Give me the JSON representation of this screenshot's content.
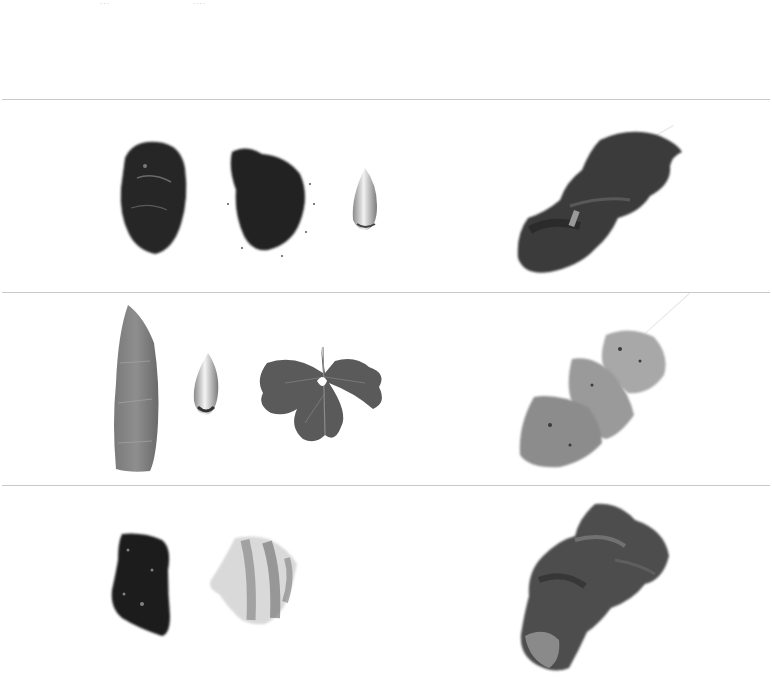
{
  "page": {
    "type": "recipe-plate",
    "palette": {
      "background": "#ffffff",
      "rule": "#c9c9c9",
      "dark": "#2a2a2a",
      "mid": "#6e6e6e",
      "light": "#bdbdbd"
    }
  },
  "top_strip": {
    "fragments": [
      {
        "text": "···",
        "x": 100
      },
      {
        "text": "····",
        "x": 193
      }
    ]
  },
  "rows": [
    {
      "id": "row-1",
      "ingredients": [
        {
          "name": "dark-meat-chunk",
          "kind": "meat"
        },
        {
          "name": "ground-spice-pile",
          "kind": "spice"
        },
        {
          "name": "garlic-clove",
          "kind": "garlic"
        }
      ],
      "result": {
        "name": "grilled-dark-meat-skewer",
        "kind": "skewer"
      }
    },
    {
      "id": "row-2",
      "ingredients": [
        {
          "name": "chicken-strip",
          "kind": "meat"
        },
        {
          "name": "garlic-clove",
          "kind": "garlic"
        },
        {
          "name": "parsley-leaf",
          "kind": "herb"
        }
      ],
      "result": {
        "name": "grilled-chicken-skewer",
        "kind": "skewer"
      }
    },
    {
      "id": "row-3",
      "ingredients": [
        {
          "name": "liver-chunk",
          "kind": "meat"
        },
        {
          "name": "pork-belly-slice",
          "kind": "meat"
        }
      ],
      "result": {
        "name": "grilled-mixed-meat-pieces",
        "kind": "dish"
      }
    }
  ]
}
